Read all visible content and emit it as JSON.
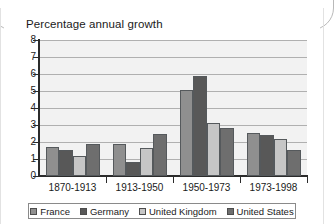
{
  "chart_data": {
    "type": "bar",
    "title": "Percentage annual growth",
    "xlabel": "",
    "ylabel": "",
    "ylim": [
      0,
      8
    ],
    "ytick_step": 1,
    "yticks": [
      "8",
      "7",
      "6",
      "5",
      "4",
      "3",
      "2",
      "1",
      "0"
    ],
    "grid": true,
    "legend_position": "bottom",
    "categories": [
      "1870-1913",
      "1913-1950",
      "1950-1973",
      "1973-1998"
    ],
    "series": [
      {
        "name": "France",
        "color": "#8f8f8f",
        "values": [
          1.7,
          1.9,
          5.05,
          2.55
        ]
      },
      {
        "name": "Germany",
        "color": "#585858",
        "values": [
          1.55,
          0.8,
          5.9,
          2.4
        ]
      },
      {
        "name": "United Kingdom",
        "color": "#c6c6c6",
        "values": [
          1.2,
          1.65,
          3.1,
          2.2
        ]
      },
      {
        "name": "United States",
        "color": "#6e6e6e",
        "values": [
          1.9,
          2.45,
          2.8,
          1.55
        ]
      }
    ]
  },
  "legend": {
    "items": [
      {
        "label": "France"
      },
      {
        "label": "Germany"
      },
      {
        "label": "United Kingdom"
      },
      {
        "label": "United States"
      }
    ]
  }
}
